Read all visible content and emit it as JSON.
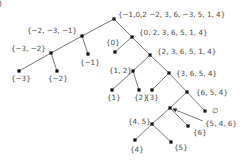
{
  "diagram": {
    "type": "tree",
    "corner_mark": ")",
    "nodes": [
      {
        "id": "root",
        "label": "{−1,0,2 −2, 3, 6, −3, 5, 1, 4}",
        "x": 114,
        "y": 19,
        "lx": 118,
        "ly": 17
      },
      {
        "id": "n1",
        "label": "{−2, −3, −1}",
        "x": 82,
        "y": 36,
        "lx": 27,
        "ly": 33
      },
      {
        "id": "n2",
        "label": "{−3, −2}",
        "x": 51,
        "y": 53,
        "lx": 11,
        "ly": 51
      },
      {
        "id": "n3",
        "label": "{−3}",
        "x": 19,
        "y": 71,
        "lx": 11,
        "ly": 81
      },
      {
        "id": "n4",
        "label": "{−2}",
        "x": 57,
        "y": 71,
        "lx": 48,
        "ly": 81
      },
      {
        "id": "n5",
        "label": "{−1}",
        "x": 88,
        "y": 54,
        "lx": 80,
        "ly": 65
      },
      {
        "id": "n6",
        "label": "{0, 2, 3, 6, 5, 1, 4}",
        "x": 132,
        "y": 37,
        "lx": 139,
        "ly": 35
      },
      {
        "id": "n7",
        "label": "{0}",
        "x": 115,
        "y": 52,
        "lx": 106,
        "ly": 45
      },
      {
        "id": "n8",
        "label": "{2, 3, 6, 5, 1, 4}",
        "x": 150,
        "y": 55,
        "lx": 157,
        "ly": 54
      },
      {
        "id": "n9",
        "label": "{1, 2}",
        "x": 133,
        "y": 71,
        "lx": 109,
        "ly": 73
      },
      {
        "id": "n10",
        "label": "{1}",
        "x": 112,
        "y": 90,
        "lx": 107,
        "ly": 100
      },
      {
        "id": "n11",
        "label": "{2}",
        "x": 139,
        "y": 90,
        "lx": 134,
        "ly": 100
      },
      {
        "id": "n12",
        "label": "{3, 6, 5, 4}",
        "x": 169,
        "y": 73,
        "lx": 176,
        "ly": 76
      },
      {
        "id": "n13",
        "label": "{3}",
        "x": 152,
        "y": 90,
        "lx": 145,
        "ly": 100
      },
      {
        "id": "n14",
        "label": "{6, 5, 4}",
        "x": 187,
        "y": 92,
        "lx": 196,
        "ly": 95
      },
      {
        "id": "n15",
        "label": "",
        "x": 170,
        "y": 108,
        "lx": 0,
        "ly": 0
      },
      {
        "id": "n16",
        "label": "∅",
        "x": 205,
        "y": 111,
        "lx": 212,
        "ly": 113
      },
      {
        "id": "n17",
        "label": "{4, 5}",
        "x": 152,
        "y": 124,
        "lx": 128,
        "ly": 124
      },
      {
        "id": "n18",
        "label": "{6}",
        "x": 188,
        "y": 126,
        "lx": 193,
        "ly": 135
      },
      {
        "id": "n19",
        "label": "{4}",
        "x": 135,
        "y": 140,
        "lx": 130,
        "ly": 152
      },
      {
        "id": "n20",
        "label": "{5}",
        "x": 171,
        "y": 142,
        "lx": 174,
        "ly": 150
      }
    ],
    "edges": [
      [
        "root",
        "n1"
      ],
      [
        "n1",
        "n2"
      ],
      [
        "n2",
        "n3"
      ],
      [
        "n2",
        "n4"
      ],
      [
        "n1",
        "n5"
      ],
      [
        "root",
        "n6"
      ],
      [
        "n6",
        "n7"
      ],
      [
        "n6",
        "n8"
      ],
      [
        "n8",
        "n9"
      ],
      [
        "n9",
        "n10"
      ],
      [
        "n9",
        "n11"
      ],
      [
        "n8",
        "n12"
      ],
      [
        "n12",
        "n13"
      ],
      [
        "n12",
        "n14"
      ],
      [
        "n14",
        "n15"
      ],
      [
        "n14",
        "n16"
      ],
      [
        "n15",
        "n17"
      ],
      [
        "n15",
        "n18"
      ],
      [
        "n17",
        "n19"
      ],
      [
        "n17",
        "n20"
      ]
    ],
    "callout": {
      "label": "{5, 4, 6}",
      "from_x": 203,
      "from_y": 121,
      "to_x": 173,
      "to_y": 109,
      "lx": 205,
      "ly": 126
    }
  }
}
